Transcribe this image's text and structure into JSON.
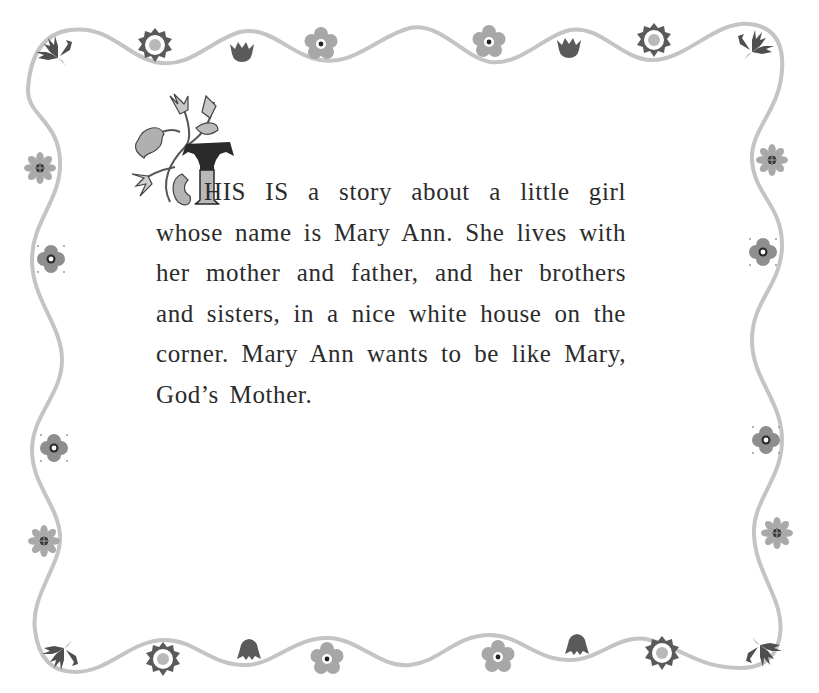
{
  "page": {
    "type": "storybook-page",
    "background_color": "#ffffff",
    "text_color": "#2b2b2b",
    "border_line_color": "#c4c4c4"
  },
  "drop_cap": {
    "letter": "T",
    "style": "ornamental-foliage"
  },
  "story": {
    "lines": [
      "HIS IS a story about a little girl",
      "whose name is Mary Ann. She lives with",
      "her mother and father, and her brothers",
      "and sisters, in a nice white house on the",
      "corner. Mary Ann wants to be like Mary,",
      "God’s Mother."
    ]
  },
  "border": {
    "top_ornaments": [
      "leaf-sprig-icon",
      "sunflower-icon",
      "tulip-icon",
      "daisy-icon",
      "daisy-icon",
      "tulip-icon",
      "sunflower-icon",
      "leaf-sprig-icon"
    ],
    "left_ornaments": [
      "petal-flower-icon",
      "blossom-icon",
      "blossom-icon",
      "petal-flower-icon"
    ],
    "right_ornaments": [
      "petal-flower-icon",
      "blossom-icon",
      "blossom-icon",
      "petal-flower-icon"
    ],
    "bottom_ornaments": [
      "leaf-sprig-icon",
      "sunflower-icon",
      "bellflower-icon",
      "daisy-icon",
      "daisy-icon",
      "bellflower-icon",
      "sunflower-icon",
      "leaf-sprig-icon"
    ]
  }
}
